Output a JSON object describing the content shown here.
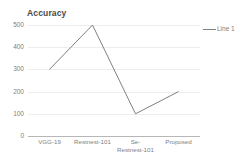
{
  "chart_data": {
    "type": "line",
    "title": "Accuracy",
    "xlabel": "",
    "ylabel": "",
    "categories": [
      "VGG-19",
      "Restnest-101",
      "Se-\nRestnest-101",
      "Proposed"
    ],
    "series": [
      {
        "name": "Line 1",
        "values": [
          300,
          500,
          100,
          200
        ],
        "color": "#808080"
      }
    ],
    "ylim": [
      0,
      500
    ],
    "yticks": [
      500,
      400,
      300,
      200,
      100,
      0
    ],
    "ytick_labels": [
      "500",
      "400",
      "300",
      "200",
      "100",
      "0"
    ],
    "grid": true,
    "grid_color": "#ededed",
    "axis_color": "#b7b7b7",
    "legend": {
      "position": "right",
      "entries": [
        {
          "label": "Line 1",
          "color": "#808080"
        }
      ]
    },
    "background": "#ffffff"
  }
}
